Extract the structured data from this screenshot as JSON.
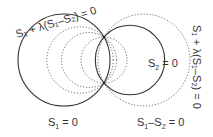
{
  "diagram": {
    "labels": {
      "s1": {
        "main": "S",
        "sub": "1",
        "rest": " = 0"
      },
      "s2": {
        "main": "S",
        "sub": "2",
        "rest": " = 0"
      },
      "radical_axis": {
        "a": "S",
        "a_sub": "1",
        "mid": "–S",
        "b_sub": "2",
        "rest": " = 0"
      },
      "family_left": "S₁ + λ(S₁–S₂) = 0",
      "family_right": "S₁ + λ(S₁–S₂) = 0"
    },
    "colors": {
      "solid": "#333333",
      "dotted": "#555555",
      "background": "#ffffff"
    },
    "circles": [
      {
        "name": "S1",
        "cx": 64,
        "cy": 60,
        "r": 46,
        "style": "solid"
      },
      {
        "name": "S2",
        "cx": 130,
        "cy": 60,
        "r": 34.7,
        "style": "solid"
      },
      {
        "name": "family-1",
        "cx": 144,
        "cy": 60,
        "r": 46,
        "style": "dotted"
      },
      {
        "name": "family-2",
        "cx": 80,
        "cy": 60,
        "r": 33.2,
        "style": "dotted"
      },
      {
        "name": "family-3",
        "cx": 89,
        "cy": 60,
        "r": 27.5,
        "style": "dotted"
      },
      {
        "name": "family-4",
        "cx": 104,
        "cy": 60,
        "r": 23,
        "style": "dotted"
      }
    ],
    "intersections": [
      {
        "x": 104,
        "y": 37
      },
      {
        "x": 104,
        "y": 83
      }
    ]
  }
}
